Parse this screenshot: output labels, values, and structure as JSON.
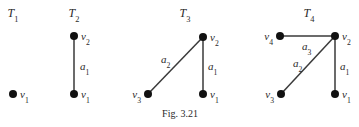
{
  "caption": "Fig. 3.21",
  "trees": [
    {
      "title": "T",
      "title_sub": "1",
      "title_pos": [
        13,
        17
      ],
      "nodes": [
        {
          "id": "v1",
          "name": "v",
          "sub": "1",
          "x": 13,
          "y": 94,
          "label_side": "right"
        }
      ],
      "edges": []
    },
    {
      "title": "T",
      "title_sub": "2",
      "title_pos": [
        74,
        17
      ],
      "nodes": [
        {
          "id": "v2",
          "name": "v",
          "sub": "2",
          "x": 74,
          "y": 36,
          "label_side": "right"
        },
        {
          "id": "v1",
          "name": "v",
          "sub": "1",
          "x": 74,
          "y": 94,
          "label_side": "right"
        }
      ],
      "edges": [
        {
          "name": "a",
          "sub": "1",
          "from": "v2",
          "to": "v1",
          "lx": 80,
          "ly": 70
        }
      ]
    },
    {
      "title": "T",
      "title_sub": "3",
      "title_pos": [
        185,
        17
      ],
      "nodes": [
        {
          "id": "v2",
          "name": "v",
          "sub": "2",
          "x": 203,
          "y": 37,
          "label_side": "right"
        },
        {
          "id": "v1",
          "name": "v",
          "sub": "1",
          "x": 203,
          "y": 94,
          "label_side": "right"
        },
        {
          "id": "v3",
          "name": "v",
          "sub": "3",
          "x": 148,
          "y": 94,
          "label_side": "left"
        }
      ],
      "edges": [
        {
          "name": "a",
          "sub": "1",
          "from": "v2",
          "to": "v1",
          "lx": 208,
          "ly": 70
        },
        {
          "name": "a",
          "sub": "2",
          "from": "v2",
          "to": "v3",
          "lx": 161,
          "ly": 63
        }
      ]
    },
    {
      "title": "T",
      "title_sub": "4",
      "title_pos": [
        309,
        17
      ],
      "nodes": [
        {
          "id": "v4",
          "name": "v",
          "sub": "4",
          "x": 280,
          "y": 36,
          "label_side": "left"
        },
        {
          "id": "v2",
          "name": "v",
          "sub": "2",
          "x": 335,
          "y": 36,
          "label_side": "right"
        },
        {
          "id": "v3",
          "name": "v",
          "sub": "3",
          "x": 281,
          "y": 94,
          "label_side": "left"
        },
        {
          "id": "v1",
          "name": "v",
          "sub": "1",
          "x": 335,
          "y": 94,
          "label_side": "right"
        }
      ],
      "edges": [
        {
          "name": "a",
          "sub": "3",
          "from": "v4",
          "to": "v2",
          "lx": 302,
          "ly": 50
        },
        {
          "name": "a",
          "sub": "2",
          "from": "v2",
          "to": "v3",
          "lx": 293,
          "ly": 67
        },
        {
          "name": "a",
          "sub": "1",
          "from": "v2",
          "to": "v1",
          "lx": 340,
          "ly": 70
        }
      ]
    }
  ]
}
